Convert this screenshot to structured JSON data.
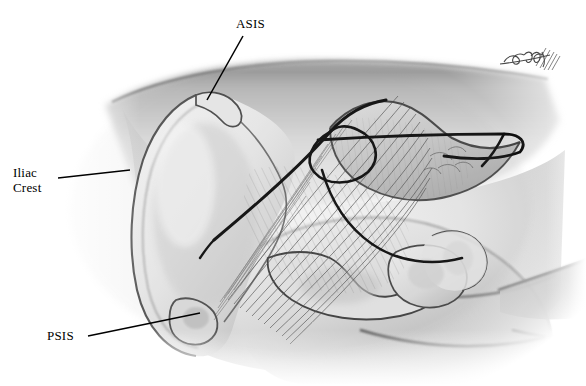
{
  "figure": {
    "background_color": "#ffffff",
    "ink_color": "#000000",
    "width": 586,
    "height": 386,
    "medium": "grayscale airbrush medical illustration"
  },
  "labels": {
    "asis": {
      "text": "ASIS",
      "meaning": "Anterior Superior Iliac Spine",
      "x": 236,
      "y": 17
    },
    "iliac_crest": {
      "text": "Iliac\nCrest",
      "line1": "Iliac",
      "line2": "Crest",
      "meaning": "Iliac Crest",
      "x": 13,
      "y": 166
    },
    "psis": {
      "text": "PSIS",
      "meaning": "Posterior Superior Iliac Spine",
      "x": 47,
      "y": 329
    }
  },
  "leaders": {
    "asis": {
      "x1": 243,
      "y1": 36,
      "x2": 207,
      "y2": 100
    },
    "iliac_crest": {
      "x1": 58,
      "y1": 178,
      "x2": 130,
      "y2": 170
    },
    "psis": {
      "x1": 88,
      "y1": 336,
      "x2": 200,
      "y2": 313
    }
  },
  "signature": {
    "text": "Sheila",
    "description": "artist cursive signature with hatching",
    "x": 500,
    "y": 46
  },
  "anatomy": {
    "structures": [
      "Ilium",
      "Iliac crest",
      "Anterior superior iliac spine",
      "Posterior superior iliac spine",
      "Sacrum",
      "Sacroiliac ligaments",
      "Greater sciatic notch",
      "Ischial tuberosity",
      "Gluteal soft tissue contour",
      "Posterior surgical approach line"
    ]
  }
}
